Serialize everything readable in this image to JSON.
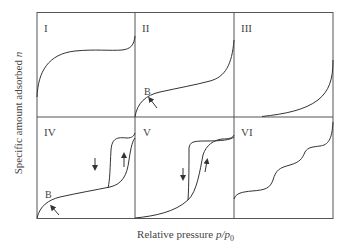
{
  "figure": {
    "ylabel": "Specific amount adsorbed n",
    "ylabel_text": "Specific amount adsorbed",
    "ylabel_var": "n",
    "xlabel_text": "Relative pressure",
    "xlabel_var": "p/p",
    "xlabel_sub": "0"
  },
  "panels": [
    {
      "id": "I",
      "label": "I"
    },
    {
      "id": "II",
      "label": "II",
      "point_label": "B"
    },
    {
      "id": "III",
      "label": "III"
    },
    {
      "id": "IV",
      "label": "IV",
      "point_label": "B"
    },
    {
      "id": "V",
      "label": "V"
    },
    {
      "id": "VI",
      "label": "VI"
    }
  ],
  "colors": {
    "line": "#333333",
    "frame": "#555555",
    "background": "#ffffff"
  }
}
